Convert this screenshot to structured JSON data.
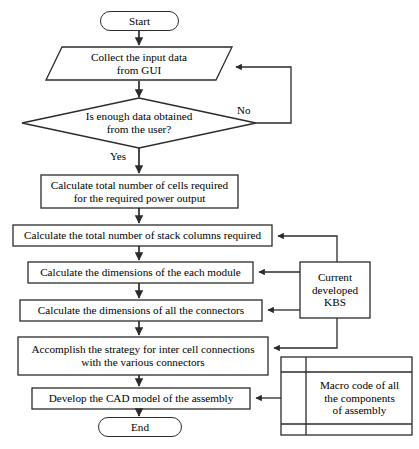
{
  "diagram": {
    "line_color": "#2b2b2b",
    "fill_color": "#ffffff",
    "text_color": "#000000"
  },
  "nodes": {
    "start": {
      "label": "Start",
      "shape": "terminator"
    },
    "collect_input": {
      "label": "Collect the input data\nfrom GUI",
      "shape": "parallelogram"
    },
    "decision": {
      "label": "Is enough data obtained\nfrom the user?",
      "shape": "diamond"
    },
    "calc_cells": {
      "label": "Calculate total number of cells required\nfor the required power output",
      "shape": "process"
    },
    "calc_stacks": {
      "label": "Calculate the total number of stack columns required",
      "shape": "process"
    },
    "calc_module": {
      "label": "Calculate the dimensions of the each module",
      "shape": "process"
    },
    "calc_connectors": {
      "label": "Calculate the dimensions of all the connectors",
      "shape": "process"
    },
    "inter_cell": {
      "label": "Accomplish the strategy for inter cell connections\nwith the various connectors",
      "shape": "process"
    },
    "develop_cad": {
      "label": "Develop the CAD model of the assembly",
      "shape": "process"
    },
    "end": {
      "label": "End",
      "shape": "terminator"
    },
    "kbs": {
      "label": "Current\ndeveloped\nKBS",
      "shape": "process"
    },
    "macro_code": {
      "label": "Macro code of all\nthe components\nof assembly",
      "shape": "multi-document"
    }
  },
  "edge_labels": {
    "yes": "Yes",
    "no": "No"
  }
}
